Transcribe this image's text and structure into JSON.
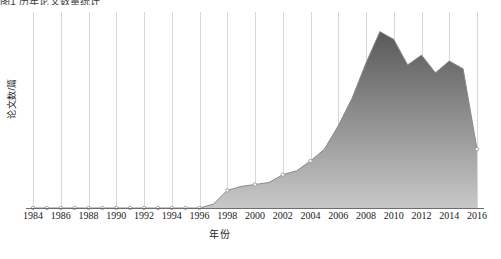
{
  "figure": {
    "title_clipped": "图1 历年论文数量统计",
    "background_color": "#ffffff"
  },
  "axes": {
    "x_title": "年份",
    "y_title": "论文数/篇",
    "axis_color": "#6e6e6e",
    "grid_color": "#d8d8d8"
  },
  "style": {
    "line_color": "#8a8a8a",
    "marker_color": "#9a9a9a",
    "fill_top_color": "#595959",
    "fill_bottom_color": "#c8c8c8"
  },
  "chart_data": {
    "type": "area",
    "title": "图1 历年论文数量统计",
    "xlabel": "年份",
    "ylabel": "论文数/篇",
    "grid": true,
    "legend": "none",
    "xlim": [
      1984,
      2016
    ],
    "ylim": [
      0,
      100
    ],
    "tick_labels": [
      "1984",
      "1986",
      "1988",
      "1990",
      "1992",
      "1994",
      "1996",
      "1998",
      "2000",
      "2002",
      "2004",
      "2006",
      "2008",
      "2010",
      "2012",
      "2014",
      "2016"
    ],
    "x": [
      1984,
      1985,
      1986,
      1987,
      1988,
      1989,
      1990,
      1991,
      1992,
      1993,
      1994,
      1995,
      1996,
      1997,
      1998,
      1999,
      2000,
      2001,
      2002,
      2003,
      2004,
      2005,
      2006,
      2007,
      2008,
      2009,
      2010,
      2011,
      2012,
      2013,
      2014,
      2015,
      2016
    ],
    "values": [
      0,
      0,
      0,
      0,
      0,
      0,
      0,
      0,
      0,
      0,
      0,
      0,
      0,
      2,
      9,
      11,
      12,
      13,
      17,
      19,
      24,
      30,
      42,
      56,
      74,
      90,
      86,
      73,
      78,
      69,
      75,
      71,
      30
    ]
  }
}
